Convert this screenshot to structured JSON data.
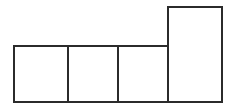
{
  "figure": {
    "title": "Composite rectilinear figure",
    "canvas": {
      "width": 234,
      "height": 111,
      "background_color": "#ffffff"
    },
    "style": {
      "stroke_color": "#2b2b2b",
      "stroke_width": 2,
      "fill_color": "#ffffff"
    },
    "shapes": [
      {
        "name": "square-1",
        "role": "left square",
        "x": 14,
        "y": 46,
        "width": 54,
        "height": 56
      },
      {
        "name": "square-2",
        "role": "middle square",
        "x": 68,
        "y": 46,
        "width": 50,
        "height": 56
      },
      {
        "name": "square-3",
        "role": "right square",
        "x": 118,
        "y": 46,
        "width": 50,
        "height": 56
      },
      {
        "name": "tall-rectangle",
        "role": "vertical rectangle at far right",
        "x": 168,
        "y": 7,
        "width": 54,
        "height": 95
      }
    ]
  }
}
